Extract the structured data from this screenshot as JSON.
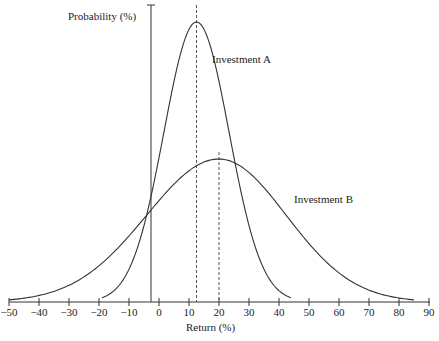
{
  "chart_data": {
    "type": "line",
    "title": "",
    "xlabel": "Return (%)",
    "ylabel": "Probability (%)",
    "xlim": [
      -50,
      90
    ],
    "x_ticks": [
      -50,
      -40,
      -30,
      -20,
      -10,
      0,
      10,
      20,
      30,
      40,
      50,
      60,
      70,
      80,
      90
    ],
    "grid": false,
    "legend": "inline labels",
    "series": [
      {
        "name": "Investment A",
        "distribution": "bell curve",
        "mean": 12.5,
        "support": [
          -19,
          44
        ],
        "relative_peak_height": 1.0,
        "color": "#333333"
      },
      {
        "name": "Investment B",
        "distribution": "bell curve",
        "mean": 20,
        "support": [
          -50,
          85
        ],
        "relative_peak_height": 0.49,
        "color": "#333333"
      }
    ],
    "annotations": [
      {
        "type": "dashed-vertical",
        "x": 12.5,
        "label": "mean of Investment A"
      },
      {
        "type": "dashed-vertical",
        "x": 20,
        "label": "mean of Investment B"
      }
    ]
  },
  "labels": {
    "ylabel": "Probability (%)",
    "xlabel": "Return (%)",
    "series_a": "Investment A",
    "series_b": "Investment B"
  }
}
